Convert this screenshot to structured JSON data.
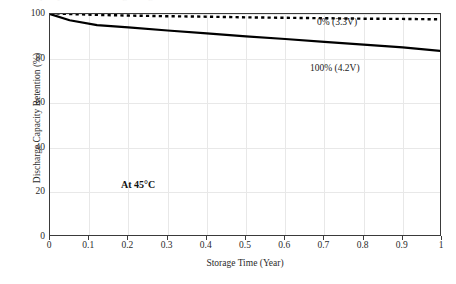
{
  "figure": {
    "clipped_title_sliver": "Capacity Retention During Storage",
    "annotation": "At 45°C"
  },
  "chart_data": {
    "type": "line",
    "title": "",
    "xlabel": "Storage Time (Year)",
    "ylabel": "Discharge Capacity Retention (%)",
    "xlim": [
      0,
      1
    ],
    "ylim": [
      0,
      100
    ],
    "xticks": [
      "0",
      "0.1",
      "0.2",
      "0.3",
      "0.4",
      "0.5",
      "0.6",
      "0.7",
      "0.8",
      "0.9",
      "1"
    ],
    "xtick_values": [
      0,
      0.1,
      0.2,
      0.3,
      0.4,
      0.5,
      0.6,
      0.7,
      0.8,
      0.9,
      1
    ],
    "yticks": [
      "0",
      "20",
      "40",
      "60",
      "80",
      "100"
    ],
    "ytick_values": [
      0,
      20,
      40,
      60,
      80,
      100
    ],
    "grid": "both",
    "legend": "inline-annotations",
    "x": [
      0,
      0.05,
      0.12,
      0.2,
      0.3,
      0.4,
      0.5,
      0.6,
      0.7,
      0.8,
      0.9,
      1
    ],
    "series": [
      {
        "name": "0% (3.3V)",
        "style": "dotted",
        "color": "#000000",
        "label_position": "above-line-right",
        "values": [
          100.4,
          100.0,
          99.6,
          99.3,
          99.0,
          98.8,
          98.5,
          98.3,
          98.1,
          97.9,
          97.8,
          97.6
        ]
      },
      {
        "name": "100% (4.2V)",
        "style": "solid",
        "color": "#000000",
        "label_position": "below-line-right",
        "values": [
          100.0,
          97.2,
          95.0,
          94.0,
          92.6,
          91.3,
          90.0,
          88.8,
          87.5,
          86.3,
          85.0,
          83.4
        ]
      }
    ],
    "annotations": [
      {
        "text": "At 45°C",
        "x": 0.06,
        "y": 31,
        "bold": true
      }
    ]
  }
}
